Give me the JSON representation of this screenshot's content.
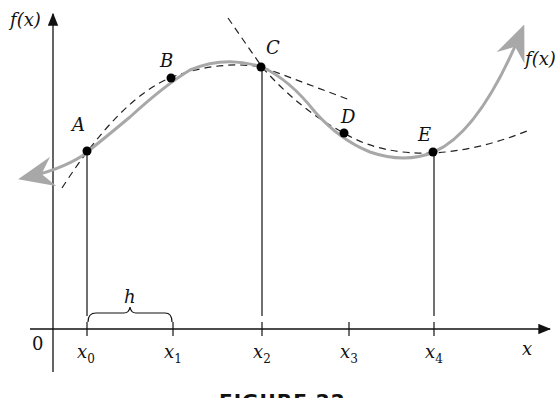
{
  "figure": {
    "caption": "FIGURE 22",
    "y_axis_label": "f(x)",
    "x_axis_label": "x",
    "origin_label": "0",
    "curve_label": "f(x)",
    "spacing_label": "h",
    "points": [
      {
        "label": "A",
        "x_tick": "x",
        "sub": "0"
      },
      {
        "label": "B",
        "x_tick": "x",
        "sub": "1"
      },
      {
        "label": "C",
        "x_tick": "x",
        "sub": "2"
      },
      {
        "label": "D",
        "x_tick": "x",
        "sub": "3"
      },
      {
        "label": "E",
        "x_tick": "x",
        "sub": "4"
      }
    ],
    "colors": {
      "curve": "#a8a8a8",
      "axes": "#111111",
      "dashed": "#222222",
      "points": "#000000"
    }
  }
}
